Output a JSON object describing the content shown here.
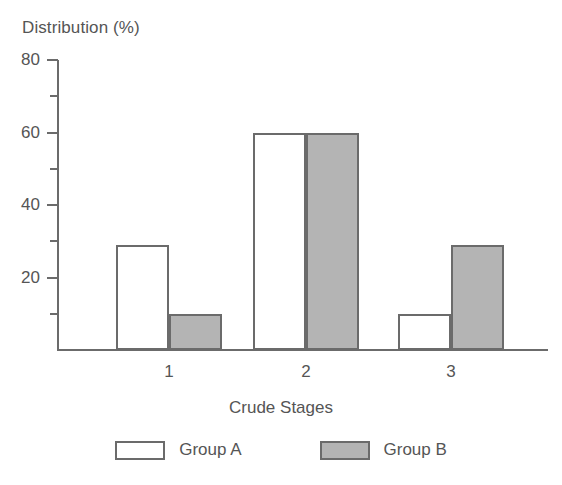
{
  "chart_data": {
    "type": "bar",
    "title": "",
    "xlabel": "Crude Stages",
    "ylabel": "Distribution (%)",
    "categories": [
      "1",
      "2",
      "3"
    ],
    "series": [
      {
        "name": "Group A",
        "values": [
          29,
          60,
          10
        ],
        "color": "#ffffff"
      },
      {
        "name": "Group B",
        "values": [
          10,
          60,
          29
        ],
        "color": "#b4b4b4"
      }
    ],
    "ylim": [
      0,
      80
    ],
    "ytick_labels": [
      "20",
      "40",
      "60",
      "80"
    ],
    "ytick_values": [
      20,
      40,
      60,
      80
    ],
    "yminor_ticks": [
      10,
      30,
      50,
      70
    ],
    "grid": false,
    "legend_position": "bottom",
    "outline_color": "#6b6b6b",
    "text_color": "#555555",
    "background": "#ffffff"
  },
  "legend": {
    "items": [
      {
        "label": "Group A",
        "swatch": "white-swatch"
      },
      {
        "label": "Group B",
        "swatch": "gray-swatch"
      }
    ]
  }
}
